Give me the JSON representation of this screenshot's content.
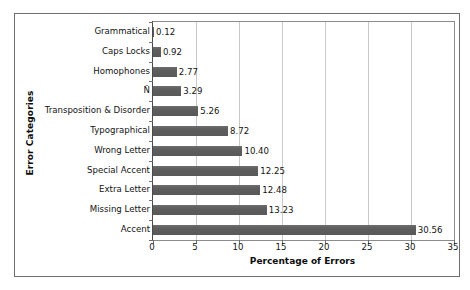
{
  "chart_data": {
    "type": "bar",
    "orientation": "horizontal",
    "title": "",
    "xlabel": "Percentage of Errors",
    "ylabel": "Error Categories",
    "categories": [
      "Grammatical",
      "Caps Locks",
      "Homophones",
      "Ñ",
      "Transposition & Disorder",
      "Typographical",
      "Wrong Letter",
      "Special Accent",
      "Extra Letter",
      "Missing Letter",
      "Accent"
    ],
    "values": [
      0.12,
      0.92,
      2.77,
      3.29,
      5.26,
      8.72,
      10.4,
      12.25,
      12.48,
      13.23,
      30.56
    ],
    "value_labels": [
      "0.12",
      "0.92",
      "2.77",
      "3.29",
      "5.26",
      "8.72",
      "10.40",
      "12.25",
      "12.48",
      "13.23",
      "30.56"
    ],
    "xlim": [
      0,
      35
    ],
    "xticks": [
      0,
      5,
      10,
      15,
      20,
      25,
      30,
      35
    ],
    "xtick_labels": [
      "0",
      "5",
      "10",
      "15",
      "20",
      "25",
      "30",
      "35"
    ],
    "grid": "vertical",
    "legend": "none",
    "bar_color": "#5e5e5e",
    "gridline_color": "#c9c9c9",
    "axis_color": "#4a4a4a",
    "plot_background": "#ffffff",
    "frame_color": "#6e6e6e"
  }
}
